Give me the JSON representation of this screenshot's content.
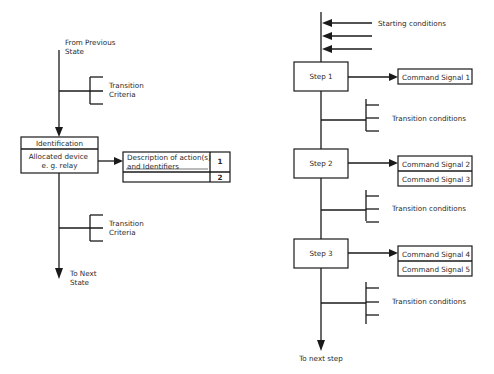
{
  "left_diagram": {
    "entry_label": [
      "From Previous",
      "State"
    ],
    "transition_top": [
      "Transition",
      "Criteria"
    ],
    "state_box": {
      "header": "Identification",
      "body": [
        "Allocated device",
        "e. g. relay"
      ]
    },
    "action_table": {
      "description": [
        "Description of action(s)",
        "and Identifiers"
      ],
      "rows": [
        "1",
        "2"
      ]
    },
    "transition_bottom": [
      "Transition",
      "Criteria"
    ],
    "exit_label": [
      "To Next",
      "State"
    ]
  },
  "right_diagram": {
    "starting_conditions_label": "Starting conditions",
    "steps": [
      {
        "label": "Step 1",
        "commands": [
          "Command Signal  1"
        ]
      },
      {
        "label": "Step 2",
        "commands": [
          "Command Signal  2",
          "Command Signal  3"
        ]
      },
      {
        "label": "Step 3",
        "commands": [
          "Command Signal  4",
          "Command Signal  5"
        ]
      }
    ],
    "transition_label": "Transition conditions",
    "exit_label": "To next step"
  }
}
